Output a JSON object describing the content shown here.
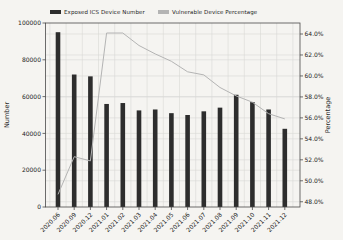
{
  "figure": {
    "background": "#f5f4f1",
    "spine_color": "#4a4a4a",
    "grid_color": "#d9d8d5"
  },
  "legend": {
    "position": "top",
    "items": [
      {
        "label": "Exposed ICS Device Number",
        "swatch_color": "#2d2d2d",
        "swatch": "rect"
      },
      {
        "label": "Vulnerable Device Percentage",
        "swatch_color": "#b4b4b4",
        "swatch": "rect"
      }
    ]
  },
  "chart_data": {
    "type": "combo",
    "categories": [
      "2020.06",
      "2020.09",
      "2020.12",
      "2021.01",
      "2021.02",
      "2021.03",
      "2021.04",
      "2021.05",
      "2021.06",
      "2021.07",
      "2021.08",
      "2021.09",
      "2021.10",
      "2021.11",
      "2021.12"
    ],
    "series": [
      {
        "name": "Exposed ICS Device Number",
        "type": "bar",
        "axis": "left",
        "color": "#2d2d2d",
        "values": [
          95000,
          72000,
          71000,
          56000,
          56500,
          52500,
          53000,
          51000,
          50000,
          52000,
          54000,
          61000,
          57000,
          53000,
          42500
        ]
      },
      {
        "name": "Vulnerable Device Percentage",
        "type": "line",
        "axis": "right",
        "color": "#b4b4b4",
        "values": [
          48.7,
          52.3,
          51.9,
          64.1,
          64.1,
          62.9,
          62.1,
          61.4,
          60.4,
          60.1,
          58.9,
          58.1,
          57.5,
          56.4,
          55.9
        ]
      }
    ],
    "left_axis": {
      "label": "Number",
      "min": 0,
      "max": 100000,
      "ticks": [
        0,
        20000,
        40000,
        60000,
        80000,
        100000
      ],
      "tick_labels": [
        "0",
        "20000",
        "40000",
        "60000",
        "80000",
        "100000"
      ]
    },
    "right_axis": {
      "label": "Percentage",
      "min": 47.5,
      "max": 65.05,
      "ticks": [
        48,
        50,
        52,
        54,
        56,
        58,
        60,
        62,
        64
      ],
      "tick_labels": [
        "48.0%",
        "50.0%",
        "52.0%",
        "54.0%",
        "56.0%",
        "58.0%",
        "60.0%",
        "62.0%",
        "64.0%"
      ]
    },
    "x_tick_rotation": -45,
    "grid": true,
    "legend_position": "top"
  }
}
